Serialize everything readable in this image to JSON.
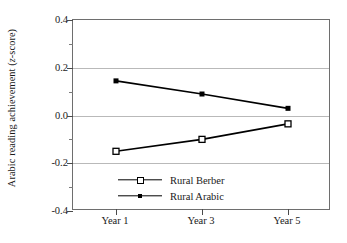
{
  "chart_data": {
    "type": "line",
    "title": "",
    "xlabel": "",
    "ylabel": "Arabic reading achievement (z-score)",
    "ylabel_plain": "Arabic reading achievement (",
    "ylabel_italic": "z",
    "ylabel_tail": "-score)",
    "categories": [
      "Year 1",
      "Year 3",
      "Year 5"
    ],
    "x": [
      1,
      3,
      5
    ],
    "ylim": [
      -0.4,
      0.4
    ],
    "yticks": [
      0.4,
      0.2,
      0.0,
      -0.2,
      -0.4
    ],
    "ytick_labels": [
      "0.4",
      "0.2",
      "0.0",
      "-0.2",
      "-0.4"
    ],
    "yticks_minor": [
      0.3,
      0.1,
      -0.1,
      -0.3
    ],
    "grid": true,
    "grid_axis": "y",
    "legend_position": "inside-bottom-center",
    "series": [
      {
        "name": "Rural Berber",
        "marker": "open-square",
        "color": "#000000",
        "values": [
          -0.15,
          -0.1,
          -0.035
        ]
      },
      {
        "name": "Rural Arabic",
        "marker": "filled-square",
        "color": "#000000",
        "values": [
          0.145,
          0.09,
          0.03
        ]
      }
    ]
  },
  "legend": {
    "items": [
      {
        "label": "Rural Berber",
        "marker": "open-square"
      },
      {
        "label": "Rural Arabic",
        "marker": "filled-square"
      }
    ]
  },
  "colors": {
    "axis": "#6e6e6e",
    "grid": "#b9b9b9",
    "series": "#000000",
    "text": "#1a1a1a",
    "background": "#ffffff"
  }
}
